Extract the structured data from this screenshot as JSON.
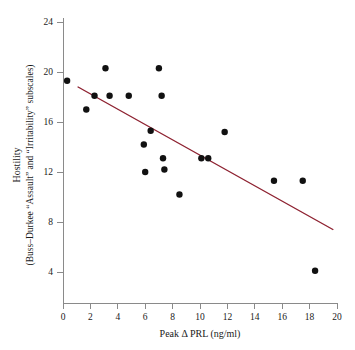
{
  "chart_data": {
    "type": "scatter",
    "title": "",
    "xlabel": "Peak Δ PRL (ng/ml)",
    "ylabel_line1": "Hostility",
    "ylabel_line2": "(Buss–Durkee “Assault” and “Irritability” subscales)",
    "xlim": [
      0,
      20
    ],
    "ylim": [
      0,
      24
    ],
    "xticks": [
      0,
      2,
      4,
      6,
      8,
      10,
      12,
      14,
      16,
      18,
      20
    ],
    "yticks": [
      4,
      8,
      12,
      16,
      20,
      24
    ],
    "xtick_labels": [
      "0",
      "2",
      "4",
      "6",
      "8",
      "10",
      "12",
      "14",
      "16",
      "18",
      "20"
    ],
    "ytick_labels": [
      "4",
      "8",
      "12",
      "16",
      "20",
      "24"
    ],
    "grid": false,
    "legend": "none",
    "marker": "filled-circle",
    "marker_color": "#111111",
    "marker_size_px": 3.2,
    "points": [
      {
        "x": 0.3,
        "y": 19.3
      },
      {
        "x": 1.7,
        "y": 17.0
      },
      {
        "x": 2.3,
        "y": 18.1
      },
      {
        "x": 3.1,
        "y": 20.3
      },
      {
        "x": 3.4,
        "y": 18.1
      },
      {
        "x": 4.8,
        "y": 18.1
      },
      {
        "x": 5.9,
        "y": 14.2
      },
      {
        "x": 6.0,
        "y": 12.0
      },
      {
        "x": 6.4,
        "y": 15.3
      },
      {
        "x": 7.0,
        "y": 20.3
      },
      {
        "x": 7.2,
        "y": 18.1
      },
      {
        "x": 7.3,
        "y": 13.1
      },
      {
        "x": 7.4,
        "y": 12.2
      },
      {
        "x": 8.5,
        "y": 10.2
      },
      {
        "x": 10.1,
        "y": 13.1
      },
      {
        "x": 10.6,
        "y": 13.1
      },
      {
        "x": 11.8,
        "y": 15.2
      },
      {
        "x": 15.4,
        "y": 11.3
      },
      {
        "x": 17.5,
        "y": 11.3
      },
      {
        "x": 18.4,
        "y": 4.1
      }
    ],
    "fit_line": {
      "type": "linear-regression",
      "color": "#8e2231",
      "x_start": 1.1,
      "y_start": 18.8,
      "x_end": 19.7,
      "y_end": 7.4
    }
  }
}
